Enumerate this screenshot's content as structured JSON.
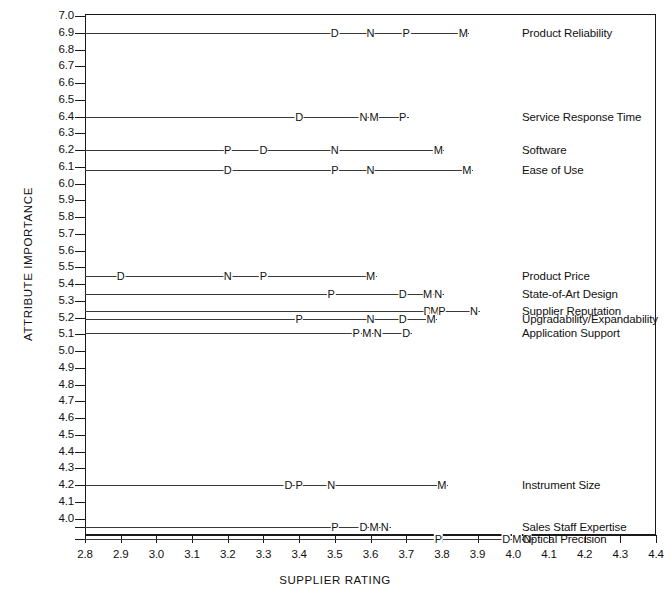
{
  "chart_data": {
    "type": "scatter",
    "title": "",
    "xlabel": "SUPPLIER RATING",
    "ylabel": "ATTRIBUTE IMPORTANCE",
    "xlim": [
      2.8,
      4.4
    ],
    "ylim": [
      3.85,
      7.0
    ],
    "grid": false,
    "legend": "none",
    "xticks": [
      "2.8",
      "2.9",
      "3.0",
      "3.1",
      "3.2",
      "3.3",
      "3.4",
      "3.5",
      "3.6",
      "3.7",
      "3.8",
      "3.9",
      "4.0",
      "4.1",
      "4.2",
      "4.3",
      "4.4"
    ],
    "yticks": [
      "7.0",
      "6.9",
      "6.8",
      "6.7",
      "6.6",
      "6.5",
      "6.4",
      "6.3",
      "6.2",
      "6.1",
      "6.0",
      "5.9",
      "5.8",
      "5.7",
      "5.6",
      "5.5",
      "5.4",
      "5.3",
      "5.2",
      "5.1",
      "5.0",
      "4.9",
      "4.8",
      "4.7",
      "4.6",
      "4.5",
      "4.4",
      "4.3",
      "4.2",
      "4.1",
      "4.0"
    ],
    "supplier_codes": [
      "D",
      "N",
      "P",
      "M"
    ],
    "rows": [
      {
        "label": "Product Reliability",
        "importance": 6.9,
        "points": [
          {
            "code": "D",
            "rating": 3.5
          },
          {
            "code": "N",
            "rating": 3.6
          },
          {
            "code": "P",
            "rating": 3.7
          },
          {
            "code": "M",
            "rating": 3.86
          }
        ]
      },
      {
        "label": "Service Response Time",
        "importance": 6.4,
        "points": [
          {
            "code": "D",
            "rating": 3.4
          },
          {
            "code": "N",
            "rating": 3.58
          },
          {
            "code": "M",
            "rating": 3.61
          },
          {
            "code": "P",
            "rating": 3.69
          }
        ]
      },
      {
        "label": "Software",
        "importance": 6.2,
        "points": [
          {
            "code": "P",
            "rating": 3.2
          },
          {
            "code": "D",
            "rating": 3.3
          },
          {
            "code": "N",
            "rating": 3.5
          },
          {
            "code": "M",
            "rating": 3.79
          }
        ]
      },
      {
        "label": "Ease of Use",
        "importance": 6.08,
        "points": [
          {
            "code": "D",
            "rating": 3.2
          },
          {
            "code": "P",
            "rating": 3.5
          },
          {
            "code": "N",
            "rating": 3.6
          },
          {
            "code": "M",
            "rating": 3.87
          }
        ]
      },
      {
        "label": "Product Price",
        "importance": 5.45,
        "points": [
          {
            "code": "D",
            "rating": 2.9
          },
          {
            "code": "N",
            "rating": 3.2
          },
          {
            "code": "P",
            "rating": 3.3
          },
          {
            "code": "M",
            "rating": 3.6
          }
        ]
      },
      {
        "label": "State-of-Art Design",
        "importance": 5.34,
        "points": [
          {
            "code": "P",
            "rating": 3.49
          },
          {
            "code": "D",
            "rating": 3.69
          },
          {
            "code": "M",
            "rating": 3.76
          },
          {
            "code": "N",
            "rating": 3.79
          }
        ]
      },
      {
        "label": "Supplier Reputation",
        "importance": 5.24,
        "points": [
          {
            "code": "D",
            "rating": 3.76
          },
          {
            "code": "M",
            "rating": 3.78
          },
          {
            "code": "P",
            "rating": 3.8
          },
          {
            "code": "N",
            "rating": 3.89
          }
        ]
      },
      {
        "label": "Upgradability/Expandability",
        "importance": 5.19,
        "points": [
          {
            "code": "P",
            "rating": 3.4
          },
          {
            "code": "N",
            "rating": 3.6
          },
          {
            "code": "D",
            "rating": 3.69
          },
          {
            "code": "M",
            "rating": 3.77
          }
        ]
      },
      {
        "label": "Application Support",
        "importance": 5.11,
        "points": [
          {
            "code": "P",
            "rating": 3.56
          },
          {
            "code": "M",
            "rating": 3.59
          },
          {
            "code": "N",
            "rating": 3.62
          },
          {
            "code": "D",
            "rating": 3.7
          }
        ]
      },
      {
        "label": "Instrument Size",
        "importance": 4.2,
        "points": [
          {
            "code": "D",
            "rating": 3.37
          },
          {
            "code": "P",
            "rating": 3.4
          },
          {
            "code": "N",
            "rating": 3.49
          },
          {
            "code": "M",
            "rating": 3.8
          }
        ]
      },
      {
        "label": "Sales Staff Expertise",
        "importance": 3.95,
        "points": [
          {
            "code": "P",
            "rating": 3.5
          },
          {
            "code": "D",
            "rating": 3.58
          },
          {
            "code": "M",
            "rating": 3.61
          },
          {
            "code": "N",
            "rating": 3.64
          }
        ]
      },
      {
        "label": "Optical Precision",
        "importance": 3.88,
        "points": [
          {
            "code": "P",
            "rating": 3.79
          },
          {
            "code": "D",
            "rating": 3.98
          },
          {
            "code": "M",
            "rating": 4.01
          },
          {
            "code": "N",
            "rating": 4.04
          }
        ]
      }
    ]
  },
  "colors": {
    "axis": "#1a1a1a",
    "line": "#3a3a3a",
    "text": "#111111",
    "background": "#ffffff"
  }
}
